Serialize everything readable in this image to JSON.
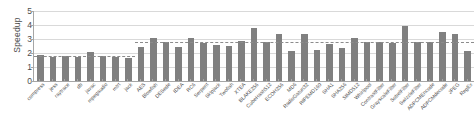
{
  "chart_data": {
    "type": "bar",
    "title": "",
    "xlabel": "",
    "ylabel": "Speedup",
    "ylim": [
      0,
      5
    ],
    "ytick_labels": [
      "0",
      "1",
      "2",
      "3",
      "4",
      "5"
    ],
    "yticks": [
      0,
      1,
      2,
      3,
      4,
      5
    ],
    "grid": true,
    "legend": "none",
    "bar_color": "#808080",
    "gridline_color": "#d9d9d9",
    "axis_color": "#a6a6a6",
    "text_color": "#4d4d4d",
    "categories": [
      "compress",
      "jess",
      "raytrace",
      "db",
      "javac",
      "mpegaudio",
      "mtrt",
      "jack",
      "AES",
      "Blowfish",
      "DESede",
      "IDEA",
      "RC6",
      "Serpent",
      "Skipjack",
      "Twofish",
      "XTEA",
      "BLAKE256",
      "CubeHash512",
      "ECOH256",
      "MD6",
      "RadioGatun32",
      "RIPEMD160",
      "SHA1",
      "SHA256",
      "SIMD512",
      "Whirlpool",
      "ContrastFilter",
      "GrayscaleFilter",
      "SobelFilter",
      "SwizzleFilter",
      "ADPCMEncode",
      "ADPCMdecode",
      "JPEG",
      "RegEx"
    ],
    "values": [
      1.88,
      1.75,
      1.76,
      1.72,
      2.04,
      1.78,
      1.75,
      1.62,
      2.42,
      3.08,
      2.79,
      2.46,
      3.05,
      2.74,
      2.6,
      2.53,
      2.89,
      3.82,
      2.77,
      3.35,
      2.13,
      3.33,
      2.21,
      2.63,
      2.38,
      3.05,
      2.78,
      2.77,
      2.75,
      3.95,
      2.78,
      2.76,
      3.51,
      3.34,
      2.16
    ],
    "average_lines": [
      {
        "label": "group-1-average",
        "value": 1.79,
        "start_index": 0,
        "end_index": 7
      },
      {
        "label": "group-2-average",
        "value": 2.76,
        "start_index": 8,
        "end_index": 34
      }
    ],
    "last_value_note": 1.72
  }
}
